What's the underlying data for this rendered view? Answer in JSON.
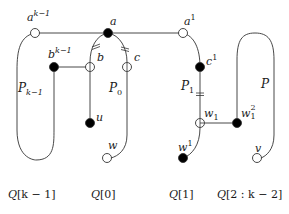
{
  "diagram": {
    "colors": {
      "stroke": "#333333",
      "fill_node": "#000000",
      "open_node": "#ffffff"
    },
    "nodes": [
      {
        "id": "a_k_minus_1",
        "label": "a",
        "sup": "k−1",
        "type": "open",
        "x": 35,
        "y": 33
      },
      {
        "id": "a",
        "label": "a",
        "type": "filled",
        "x": 108,
        "y": 33
      },
      {
        "id": "a_1",
        "label": "a",
        "sup": "1",
        "type": "open",
        "x": 183,
        "y": 33
      },
      {
        "id": "b_k_minus_1",
        "label": "b",
        "sup": "k−1",
        "type": "filled",
        "x": 54,
        "y": 67
      },
      {
        "id": "b",
        "label": "b",
        "type": "open",
        "x": 90,
        "y": 67
      },
      {
        "id": "c",
        "label": "c",
        "type": "open",
        "x": 127,
        "y": 67
      },
      {
        "id": "c_1",
        "label": "c",
        "sup": "1",
        "type": "filled",
        "x": 200,
        "y": 67
      },
      {
        "id": "u",
        "label": "u",
        "type": "filled",
        "x": 90,
        "y": 123
      },
      {
        "id": "w",
        "label": "w",
        "type": "open",
        "x": 107,
        "y": 158
      },
      {
        "id": "w_1",
        "label": "w",
        "sub": "1",
        "type": "open",
        "x": 200,
        "y": 123
      },
      {
        "id": "w_1_2",
        "label": "w",
        "sub": "1",
        "sup": "2",
        "type": "filled",
        "x": 237,
        "y": 123
      },
      {
        "id": "w_sup_1",
        "label": "w",
        "sup": "1",
        "type": "filled",
        "x": 183,
        "y": 158
      },
      {
        "id": "v",
        "label": "v",
        "type": "open",
        "x": 257,
        "y": 158
      }
    ],
    "path_labels": [
      {
        "id": "P_k_minus_1",
        "main": "P",
        "sub": "k−1"
      },
      {
        "id": "P_0",
        "main": "P",
        "sub": "0"
      },
      {
        "id": "P_1",
        "main": "P",
        "sub": "1"
      },
      {
        "id": "P",
        "main": "P"
      }
    ],
    "captions": [
      {
        "id": "Q_k_minus_1",
        "text_pre": "Q",
        "text_post": "[k − 1]"
      },
      {
        "id": "Q_0",
        "text_pre": "Q",
        "text_post": "[0]"
      },
      {
        "id": "Q_1",
        "text_pre": "Q",
        "text_post": "[1]"
      },
      {
        "id": "Q_2_k_minus_2",
        "text_pre": "Q",
        "text_post": "[2 : k − 2]"
      }
    ],
    "labels": {
      "a_k_minus_1": {
        "base": "a",
        "sup": "k−1"
      },
      "a": {
        "base": "a"
      },
      "a_1": {
        "base": "a",
        "sup": "1"
      },
      "b_k_minus_1": {
        "base": "b",
        "sup": "k−1"
      },
      "b": {
        "base": "b"
      },
      "c": {
        "base": "c"
      },
      "c_1": {
        "base": "c",
        "sup": "1"
      },
      "u": {
        "base": "u"
      },
      "w": {
        "base": "w"
      },
      "w_1": {
        "base": "w",
        "sub": "1"
      },
      "w_1_2": {
        "base": "w",
        "sub": "1",
        "sup": "2"
      },
      "w_sup_1": {
        "base": "w",
        "sup": "1"
      },
      "v": {
        "base": "v"
      }
    }
  }
}
